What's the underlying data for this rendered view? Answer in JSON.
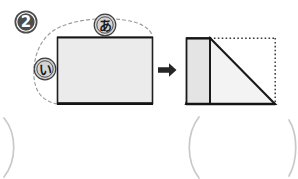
{
  "page": {
    "background_color": "#ffffff",
    "width": 298,
    "height": 179
  },
  "problem": {
    "number_badge": {
      "label": "2",
      "glyph": "❷",
      "fill_color": "#4d4d4d",
      "text_color": "#ffffff",
      "cx": 26,
      "cy": 22,
      "r": 11
    }
  },
  "left_figure": {
    "name": "source-rectangle",
    "fill_color": "#ebebeb",
    "stroke_color": "#1a1a1a",
    "x": 57,
    "y": 37,
    "width": 95,
    "height": 66,
    "labels": [
      {
        "id": "label-a",
        "text": "あ",
        "reading": "a",
        "side": "top",
        "cx": 105,
        "cy": 25,
        "r": 11,
        "fill_color": "#d4d4d4",
        "ring_color": "#4d4d4d"
      },
      {
        "id": "label-i",
        "text": "い",
        "reading": "i",
        "side": "left",
        "cx": 45,
        "cy": 69,
        "r": 11,
        "fill_color": "#d4d4d4",
        "ring_color": "#4d4d4d"
      }
    ],
    "dashed_outline": {
      "color": "#8c8c8c",
      "dash_pattern": "3 3",
      "description": "dashed curve sweeping around left and top edges"
    }
  },
  "transform_arrow": {
    "name": "right-arrow",
    "glyph": "➡",
    "color": "#262626",
    "x": 158,
    "y": 64,
    "width": 18,
    "height": 13
  },
  "right_figure": {
    "name": "result-triangle",
    "triangle": {
      "fill_color": "#f2f2f2",
      "stroke_color": "#1a1a1a",
      "apex_x": 210,
      "apex_y": 38,
      "base_left_x": 186,
      "base_right_x": 275,
      "base_y": 104
    },
    "strip": {
      "name": "left-strip-rectangle",
      "fill_color": "#e3e3e3",
      "stroke_color": "#1a1a1a",
      "x": 186,
      "y": 38,
      "width": 24,
      "height": 66
    },
    "dotted_bounds": {
      "color": "#3a3a3a",
      "dash_pattern": "1.6 2.2",
      "description": "dotted top and right sides completing the bounding rectangle"
    }
  },
  "answer_brackets": [
    {
      "id": "bracket-left-close",
      "glyph": ")",
      "x": 6,
      "y": 122,
      "color": "#c8c8c8"
    },
    {
      "id": "bracket-right-open",
      "glyph": "(",
      "x": 190,
      "y": 122,
      "color": "#c8c8c8"
    },
    {
      "id": "bracket-right-close",
      "glyph": ")",
      "x": 288,
      "y": 122,
      "color": "#c8c8c8"
    }
  ],
  "colors": {
    "ink": "#1a1a1a",
    "light_fill": "#ebebeb",
    "mid_gray": "#8c8c8c",
    "bracket_gray": "#c8c8c8"
  }
}
